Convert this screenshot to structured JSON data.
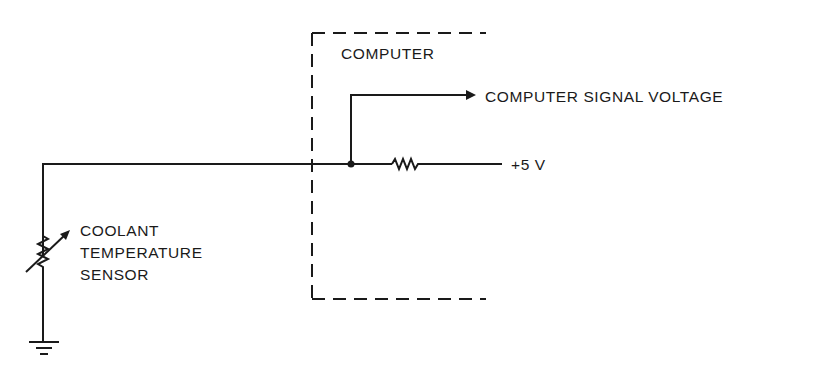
{
  "diagram": {
    "computer_label": "COMPUTER",
    "signal_label": "COMPUTER SIGNAL VOLTAGE",
    "supply_label": "+5 V",
    "sensor_label": [
      "COOLANT",
      "TEMPERATURE",
      "SENSOR"
    ]
  },
  "colors": {
    "line": "#1a1a1a",
    "background": "#ffffff"
  }
}
